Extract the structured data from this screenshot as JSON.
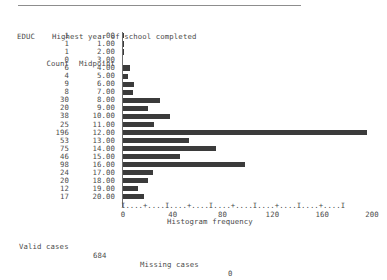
{
  "report": {
    "variable_name": "EDUC",
    "variable_label": "Highest year of school completed",
    "column_headers": {
      "count": "Count",
      "midpoint": "Midpoint"
    },
    "x_axis_title": "Histogram frequency",
    "ruler": "I....+....I....+....I....+....I....+....I....+....I",
    "footer": {
      "valid_cases_label": "Valid cases",
      "valid_cases_value": "684",
      "missing_cases_label": "Missing cases",
      "missing_cases_value": "0"
    }
  },
  "chart_data": {
    "type": "bar",
    "orientation": "horizontal",
    "title": "Highest year of school completed",
    "xlabel": "Histogram frequency",
    "ylabel": "Midpoint",
    "xlim": [
      0,
      200
    ],
    "grid": false,
    "legend": null,
    "tick_labels": [
      "0",
      "40",
      "80",
      "120",
      "160",
      "200"
    ],
    "tick_values": [
      0,
      40,
      80,
      120,
      160,
      200
    ],
    "categories": [
      ".00",
      "1.00",
      "2.00",
      "3.00",
      "4.00",
      "5.00",
      "6.00",
      "7.00",
      "8.00",
      "9.00",
      "10.00",
      "11.00",
      "12.00",
      "13.00",
      "14.00",
      "15.00",
      "16.00",
      "17.00",
      "18.00",
      "19.00",
      "20.00"
    ],
    "values": [
      1,
      1,
      1,
      0,
      6,
      4,
      9,
      8,
      30,
      20,
      38,
      25,
      196,
      53,
      75,
      46,
      98,
      24,
      20,
      12,
      17
    ],
    "count_labels": [
      "1",
      "1",
      "1",
      "0",
      "6",
      "4",
      "9",
      "8",
      "30",
      "20",
      "38",
      "25",
      "196",
      "53",
      "75",
      "46",
      "98",
      "24",
      "20",
      "12",
      "17"
    ],
    "total": 684
  }
}
